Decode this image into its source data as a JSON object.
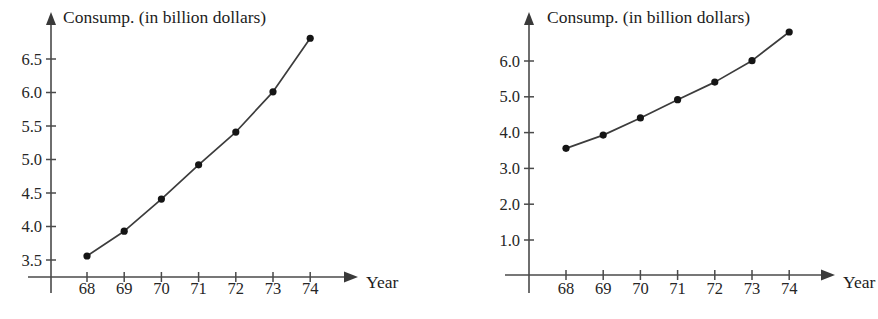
{
  "page": {
    "background_color": "#ffffff",
    "ink_color": "#333333"
  },
  "figures": [
    {
      "id": "left",
      "chart_data": {
        "type": "line",
        "title": "Consump. (in billion dollars)",
        "xlabel": "Year",
        "ylabel": "",
        "categories": [
          "68",
          "69",
          "70",
          "71",
          "72",
          "73",
          "74"
        ],
        "x": [
          68,
          69,
          70,
          71,
          72,
          73,
          74
        ],
        "values": [
          3.56,
          3.93,
          4.41,
          4.92,
          5.41,
          6.01,
          6.81
        ],
        "series": [
          {
            "name": "Consumption",
            "values": [
              3.56,
              3.93,
              4.41,
              4.92,
              5.41,
              6.01,
              6.81
            ]
          }
        ],
        "y_ticks": [
          "3.5",
          "4.0",
          "4.5",
          "5.0",
          "5.5",
          "6.0",
          "6.5"
        ],
        "y_tick_values": [
          3.5,
          4.0,
          4.5,
          5.0,
          5.5,
          6.0,
          6.5
        ],
        "x_ticks": [
          "68",
          "69",
          "70",
          "71",
          "72",
          "73",
          "74"
        ],
        "ylim": [
          3.3,
          7.0
        ],
        "xlim": [
          67.3,
          75.3
        ],
        "grid": false,
        "legend": "none",
        "marker": "filled-circle",
        "line_color": "#3c3c3c"
      }
    },
    {
      "id": "right",
      "chart_data": {
        "type": "line",
        "title": "Consump. (in billion dollars)",
        "xlabel": "Year",
        "ylabel": "",
        "categories": [
          "68",
          "69",
          "70",
          "71",
          "72",
          "73",
          "74"
        ],
        "x": [
          68,
          69,
          70,
          71,
          72,
          73,
          74
        ],
        "values": [
          3.56,
          3.93,
          4.41,
          4.92,
          5.41,
          6.01,
          6.81
        ],
        "series": [
          {
            "name": "Consumption",
            "values": [
              3.56,
              3.93,
              4.41,
              4.92,
              5.41,
              6.01,
              6.81
            ]
          }
        ],
        "y_ticks": [
          "1.0",
          "2.0",
          "3.0",
          "4.0",
          "5.0",
          "6.0"
        ],
        "y_tick_values": [
          1.0,
          2.0,
          3.0,
          4.0,
          5.0,
          6.0
        ],
        "x_ticks": [
          "68",
          "69",
          "70",
          "71",
          "72",
          "73",
          "74"
        ],
        "ylim": [
          0.0,
          7.3
        ],
        "xlim": [
          67.3,
          75.3
        ],
        "grid": false,
        "legend": "none",
        "marker": "filled-circle",
        "line_color": "#3c3c3c"
      }
    }
  ]
}
